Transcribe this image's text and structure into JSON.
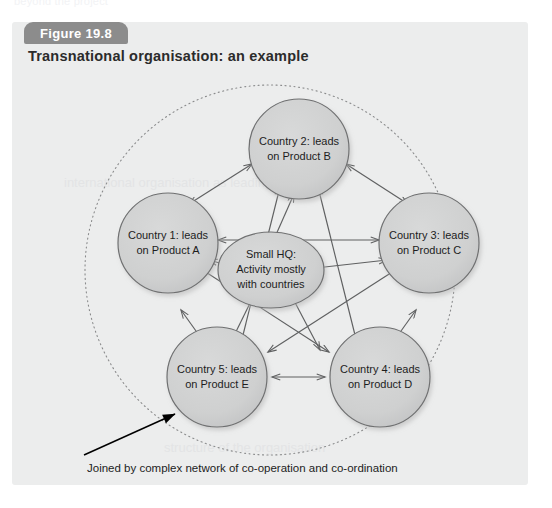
{
  "page": {
    "ghost_text": "beyond the project",
    "watermark_top": "international organisation as leading",
    "watermark_bottom": "structure of the organisation"
  },
  "figure": {
    "badge_label": "Figure 19.8",
    "title": "Transnational organisation: an example",
    "caption": "Joined by complex network of co-operation and co-ordination",
    "colors": {
      "panel_background": "#eceded",
      "badge_background": "#8c8c8c",
      "badge_text": "#ffffff",
      "node_fill": "#cfd0d0",
      "node_stroke": "#6f7071",
      "arrow_stroke": "#5f6061",
      "dashed_ring": "#8a8b8c",
      "pointer_arrow": "#000000",
      "text": "#1d1d1d"
    }
  },
  "diagram": {
    "type": "network",
    "outer_boundary": {
      "shape": "dotted-circle",
      "style": "dotted"
    },
    "center_node": {
      "id": "hq",
      "shape": "ellipse",
      "lines": [
        "Small HQ:",
        "Activity mostly",
        "with countries"
      ]
    },
    "nodes": [
      {
        "id": "country1",
        "shape": "circle",
        "position": "left",
        "lines": [
          "Country 1: leads",
          "on Product A"
        ]
      },
      {
        "id": "country2",
        "shape": "circle",
        "position": "top",
        "lines": [
          "Country 2: leads",
          "on Product B"
        ]
      },
      {
        "id": "country3",
        "shape": "circle",
        "position": "right",
        "lines": [
          "Country 3: leads",
          "on Product C"
        ]
      },
      {
        "id": "country4",
        "shape": "circle",
        "position": "bottom-right",
        "lines": [
          "Country 4: leads",
          "on Product D"
        ]
      },
      {
        "id": "country5",
        "shape": "circle",
        "position": "bottom-left",
        "lines": [
          "Country 5: leads",
          "on Product E"
        ]
      }
    ],
    "edges": [
      {
        "from": "country1",
        "to": "country2",
        "arrows": "both"
      },
      {
        "from": "country2",
        "to": "country3",
        "arrows": "both"
      },
      {
        "from": "country3",
        "to": "country4",
        "arrows": "both"
      },
      {
        "from": "country4",
        "to": "country5",
        "arrows": "both"
      },
      {
        "from": "country5",
        "to": "country1",
        "arrows": "both"
      },
      {
        "from": "country1",
        "to": "country3",
        "arrows": "both"
      },
      {
        "from": "country2",
        "to": "country4",
        "arrows": "both"
      },
      {
        "from": "country2",
        "to": "country5",
        "arrows": "both"
      },
      {
        "from": "country1",
        "to": "country4",
        "arrows": "both"
      },
      {
        "from": "country3",
        "to": "country5",
        "arrows": "both"
      },
      {
        "from": "hq",
        "to": "country1",
        "arrows": "both"
      },
      {
        "from": "hq",
        "to": "country2",
        "arrows": "both"
      },
      {
        "from": "hq",
        "to": "country3",
        "arrows": "both"
      },
      {
        "from": "hq",
        "to": "country4",
        "arrows": "both"
      },
      {
        "from": "hq",
        "to": "country5",
        "arrows": "both"
      }
    ],
    "annotation": {
      "text": "Joined by complex network of co-operation and co-ordination",
      "pointer": "arrow-up-right"
    }
  }
}
